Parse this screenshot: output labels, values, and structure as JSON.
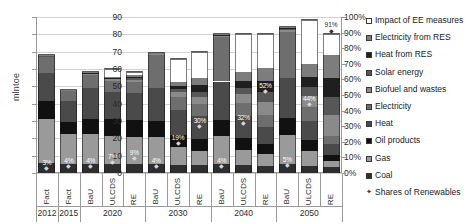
{
  "chart_data": {
    "type": "bar",
    "stacked": true,
    "title": "",
    "xlabel": "",
    "ylabel": "mlntoe",
    "ylim": [
      0,
      90
    ],
    "ytick_labels": [
      "0",
      "10",
      "20",
      "30",
      "40",
      "50",
      "60",
      "70",
      "80",
      "90"
    ],
    "secondary_axis": {
      "ylabel": "",
      "ylim": [
        0,
        100
      ],
      "unit": "%",
      "ytick_labels": [
        "0%",
        "10%",
        "20%",
        "30%",
        "40%",
        "50%",
        "60%",
        "70%",
        "80%",
        "90%",
        "100%"
      ]
    },
    "grid": true,
    "legend_position": "right",
    "categories": [
      "Fact",
      "Fact",
      "BaU",
      "ULCDS",
      "RE",
      "BaU",
      "ULCDS",
      "RE",
      "BaU",
      "ULCDS",
      "RE",
      "BaU",
      "ULCDS",
      "RE"
    ],
    "group_labels": [
      "2012",
      "2015",
      "2020",
      "2030",
      "2040",
      "2050"
    ],
    "group_spans": [
      1,
      1,
      3,
      3,
      3,
      3
    ],
    "series": [
      {
        "name": "Coal",
        "color": "#2e2e2e",
        "values": [
          5.6,
          5.0,
          5.2,
          5.0,
          5.0,
          5.0,
          4.4,
          4.4,
          5.0,
          4.4,
          4.2,
          5.0,
          4.0,
          3.2
        ]
      },
      {
        "name": "Gas",
        "color": "#9a9a9a",
        "values": [
          25.4,
          17.4,
          17.2,
          16.6,
          16.0,
          16.0,
          10.6,
          8.4,
          16.6,
          9.0,
          7.0,
          17.0,
          8.8,
          4.0
        ]
      },
      {
        "name": "Oil products",
        "color": "#111111",
        "values": [
          10.6,
          7.0,
          9.0,
          9.4,
          9.4,
          9.0,
          7.2,
          6.6,
          9.2,
          6.8,
          5.4,
          9.6,
          6.4,
          3.0
        ]
      },
      {
        "name": "Heat",
        "color": "#4a4a4a",
        "values": [
          16.0,
          12.2,
          17.4,
          15.8,
          15.8,
          19.2,
          14.4,
          13.4,
          22.0,
          12.6,
          10.0,
          23.2,
          11.0,
          6.4
        ]
      },
      {
        "name": "Electricity",
        "color": "#6e6e6e",
        "values": [
          9.4,
          5.6,
          8.0,
          6.4,
          6.2,
          18.8,
          7.4,
          6.8,
          25.4,
          7.8,
          6.8,
          26.6,
          8.0,
          5.0
        ]
      },
      {
        "name": "Biofuel and wastes",
        "color": "#8a8a8a",
        "values": [
          0.6,
          0.5,
          0.6,
          1.0,
          1.4,
          0.8,
          2.6,
          4.4,
          1.0,
          4.8,
          7.6,
          1.2,
          6.4,
          12.0
        ]
      },
      {
        "name": "Solar energy",
        "color": "#575757",
        "values": [
          0.1,
          0.1,
          0.2,
          0.4,
          0.8,
          0.2,
          1.6,
          3.0,
          0.3,
          3.6,
          5.6,
          0.4,
          5.0,
          10.0
        ]
      },
      {
        "name": "Heat from RES",
        "color": "#1f1f1f",
        "values": [
          0.1,
          0.1,
          0.2,
          0.4,
          0.8,
          0.2,
          2.0,
          3.6,
          0.3,
          4.2,
          6.4,
          0.4,
          6.0,
          11.0
        ]
      },
      {
        "name": "Electricity from RES",
        "color": "#7d7d7d",
        "values": [
          0.2,
          0.1,
          0.2,
          0.6,
          1.0,
          0.3,
          2.4,
          4.4,
          0.4,
          5.0,
          7.6,
          0.6,
          7.4,
          13.4
        ]
      },
      {
        "name": "Impact of EE measures",
        "color": "#ffffff",
        "values": [
          0.0,
          0.0,
          0.0,
          4.4,
          1.6,
          0.0,
          13.4,
          15.0,
          0.0,
          21.8,
          19.4,
          0.0,
          25.0,
          12.0
        ]
      }
    ],
    "share_labels": [
      "3%",
      "4%",
      "4%",
      "7%",
      "9%",
      "4%",
      "19%",
      "30%",
      "4%",
      "32%",
      "52%",
      "5%",
      "44%",
      "91%"
    ],
    "share_values": [
      3,
      4,
      4,
      7,
      9,
      4,
      19,
      30,
      4,
      32,
      52,
      5,
      44,
      91
    ],
    "marker_series_name": "Shares of Renewables"
  },
  "legend": {
    "items": [
      {
        "label": "Impact of EE measures",
        "color": "#ffffff",
        "type": "square"
      },
      {
        "label": "Electricity from RES",
        "color": "#7d7d7d",
        "type": "square"
      },
      {
        "label": "Heat from RES",
        "color": "#1f1f1f",
        "type": "square"
      },
      {
        "label": "Solar energy",
        "color": "#575757",
        "type": "square"
      },
      {
        "label": "Biofuel and wastes",
        "color": "#8a8a8a",
        "type": "square"
      },
      {
        "label": "Electricity",
        "color": "#6e6e6e",
        "type": "square"
      },
      {
        "label": "Heat",
        "color": "#4a4a4a",
        "type": "square"
      },
      {
        "label": "Oil products",
        "color": "#111111",
        "type": "square"
      },
      {
        "label": "Gas",
        "color": "#9a9a9a",
        "type": "square"
      },
      {
        "label": "Coal",
        "color": "#2e2e2e",
        "type": "square"
      },
      {
        "label": "Shares of Renewables",
        "color": "#3a3a3a",
        "type": "diamond"
      }
    ]
  }
}
